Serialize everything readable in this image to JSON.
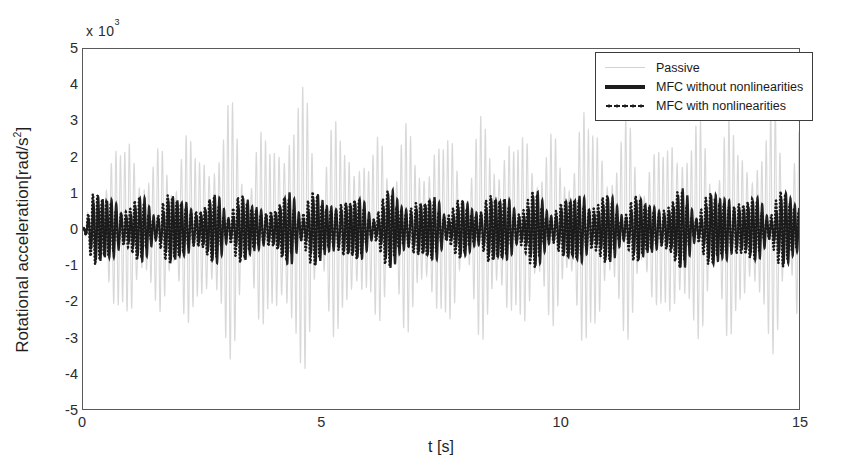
{
  "chart_data": {
    "type": "line",
    "title": "",
    "xlabel": "t [s]",
    "ylabel": "Rotational acceleration[rad/s",
    "ylabel_sup": "2",
    "ylabel_suffix": "]",
    "y_multiplier": "x 10",
    "y_multiplier_exp": "3",
    "xlim": [
      0,
      15
    ],
    "ylim": [
      -5,
      5
    ],
    "xticks": [
      "0",
      "5",
      "10",
      "15"
    ],
    "xtick_values": [
      0,
      5,
      10,
      15
    ],
    "yticks": [
      "5",
      "4",
      "3",
      "2",
      "1",
      "0",
      "-1",
      "-2",
      "-3",
      "-4",
      "-5"
    ],
    "ytick_values": [
      5,
      4,
      3,
      2,
      1,
      0,
      -1,
      -2,
      -3,
      -4,
      -5
    ],
    "grid": false,
    "legend_position": "top-right",
    "series": [
      {
        "name": "Passive",
        "style": "thin-solid",
        "color": "#d8d8d8",
        "carrier_hz": 10.2,
        "peak_abs_amplitude": 4.6,
        "typical_amplitude": 3.0,
        "envelope_t": [
          0.0,
          0.5,
          1.0,
          1.5,
          2.0,
          2.5,
          3.0,
          3.5,
          4.0,
          4.5,
          5.0,
          5.5,
          6.0,
          6.5,
          7.0,
          7.5,
          8.0,
          8.5,
          9.0,
          9.5,
          10.0,
          10.5,
          11.0,
          11.5,
          12.0,
          12.5,
          13.0,
          13.5,
          14.0,
          14.5,
          15.0
        ],
        "envelope_amp": [
          0.55,
          2.3,
          3.05,
          2.1,
          3.3,
          2.45,
          3.95,
          2.7,
          3.15,
          4.55,
          2.95,
          3.35,
          2.35,
          3.55,
          2.6,
          3.15,
          2.3,
          3.6,
          2.85,
          3.3,
          2.45,
          3.9,
          2.7,
          3.25,
          2.35,
          3.7,
          3.0,
          3.4,
          2.55,
          3.75,
          3.1
        ]
      },
      {
        "name": "MFC without nonlinearities",
        "style": "thick-solid",
        "color": "#232323",
        "carrier_hz": 10.2,
        "peak_abs_amplitude": 1.35,
        "typical_amplitude": 0.95,
        "envelope_t": [
          0.0,
          0.5,
          1.0,
          1.5,
          2.0,
          2.5,
          3.0,
          3.5,
          4.0,
          4.5,
          5.0,
          5.5,
          6.0,
          6.5,
          7.0,
          7.5,
          8.0,
          8.5,
          9.0,
          9.5,
          10.0,
          10.5,
          11.0,
          11.5,
          12.0,
          12.5,
          13.0,
          13.5,
          14.0,
          14.5,
          15.0
        ],
        "envelope_amp": [
          1.2,
          1.05,
          0.85,
          0.95,
          1.05,
          0.8,
          1.1,
          0.9,
          0.7,
          1.25,
          0.95,
          1.05,
          0.8,
          1.15,
          0.9,
          1.0,
          0.75,
          1.1,
          0.95,
          1.05,
          0.85,
          1.2,
          0.9,
          1.05,
          0.8,
          1.15,
          0.95,
          1.25,
          0.85,
          1.1,
          1.0
        ]
      },
      {
        "name": "MFC with nonlinearities",
        "style": "dotted",
        "color": "#1a1a1a",
        "carrier_hz": 10.2,
        "peak_abs_amplitude": 1.35,
        "typical_amplitude": 0.95,
        "envelope_t": [
          0.0,
          0.5,
          1.0,
          1.5,
          2.0,
          2.5,
          3.0,
          3.5,
          4.0,
          4.5,
          5.0,
          5.5,
          6.0,
          6.5,
          7.0,
          7.5,
          8.0,
          8.5,
          9.0,
          9.5,
          10.0,
          10.5,
          11.0,
          11.5,
          12.0,
          12.5,
          13.0,
          13.5,
          14.0,
          14.5,
          15.0
        ],
        "envelope_amp": [
          1.22,
          1.02,
          0.88,
          0.92,
          1.08,
          0.78,
          1.12,
          0.88,
          0.72,
          1.22,
          0.98,
          1.02,
          0.82,
          1.12,
          0.92,
          0.98,
          0.78,
          1.12,
          0.92,
          1.08,
          0.82,
          1.22,
          0.92,
          1.02,
          0.82,
          1.12,
          0.98,
          1.22,
          0.88,
          1.12,
          0.98
        ]
      }
    ]
  },
  "legend": {
    "items": [
      {
        "label": "Passive"
      },
      {
        "label": "MFC without nonlinearities"
      },
      {
        "label": "MFC with nonlinearities"
      }
    ]
  }
}
